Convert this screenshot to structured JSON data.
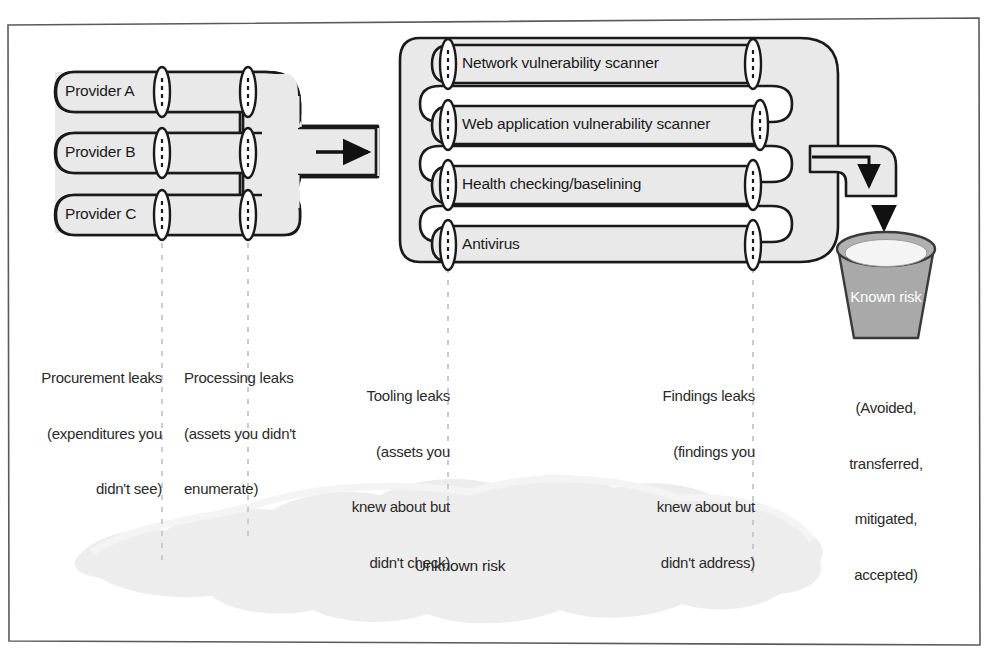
{
  "diagram": {
    "colors": {
      "pipe_fill": "#e9e9e9",
      "pipe_stroke": "#1a1a1a",
      "bucket_body": "#a9a9a9",
      "bucket_liquid": "#f2f2f2",
      "cloud_fill": "#ededed",
      "dashed_line": "#c9c9c9",
      "frame_stroke": "#555555",
      "text": "#1c1c1c",
      "known_text": "#ffffff"
    },
    "providers": [
      {
        "label": "Provider A"
      },
      {
        "label": "Provider B"
      },
      {
        "label": "Provider C"
      }
    ],
    "tools": [
      {
        "label": "Network vulnerability scanner"
      },
      {
        "label": "Web application vulnerability scanner"
      },
      {
        "label": "Health checking/baselining"
      },
      {
        "label": "Antivirus"
      }
    ],
    "flow_arrow": {
      "name": "right-arrow",
      "glyph": "→"
    },
    "output_arrow": {
      "name": "down-arrow",
      "glyph": "↓"
    },
    "leaks": [
      {
        "key": "procurement",
        "line1": "Procurement leaks",
        "line2": "(expenditures you",
        "line3": "didn't see)",
        "align": "right"
      },
      {
        "key": "processing",
        "line1": "Processing leaks",
        "line2": "(assets you didn't",
        "line3": "enumerate)",
        "align": "left"
      },
      {
        "key": "tooling",
        "line1": "Tooling leaks",
        "line2": "(assets you",
        "line3": "knew about but",
        "line4": "didn't check)",
        "align": "right"
      },
      {
        "key": "findings",
        "line1": "Findings leaks",
        "line2": "(findings you",
        "line3": "knew about but",
        "line4": "didn't address)",
        "align": "right"
      }
    ],
    "bucket": {
      "label": "Known risk",
      "caption_line1": "(Avoided,",
      "caption_line2": "transferred,",
      "caption_line3": "mitigated,",
      "caption_line4": "accepted)"
    },
    "cloud": {
      "label": "Unknown risk"
    }
  }
}
